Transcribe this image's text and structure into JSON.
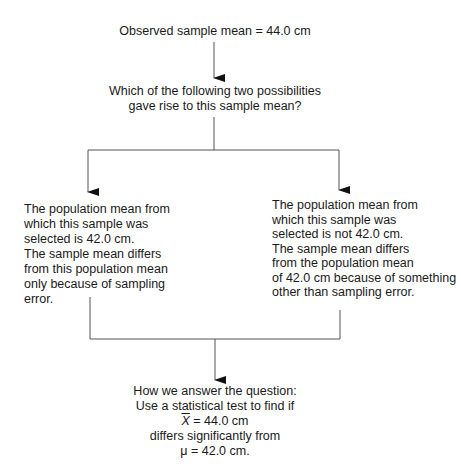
{
  "top": {
    "observed": "Observed sample mean = 44.0 cm"
  },
  "question": {
    "lines": [
      "Which of the following two possibilities",
      "gave rise to this sample mean?"
    ]
  },
  "left_option": {
    "lines": [
      "The population mean from",
      "which this sample was",
      "selected is 42.0 cm.",
      "The sample mean differs",
      "from this population mean",
      "only because of sampling",
      "error."
    ]
  },
  "right_option": {
    "lines": [
      "The population mean from",
      "which this sample was",
      "selected is not 42.0 cm.",
      "The sample mean differs",
      "from the population mean",
      "of 42.0 cm because of something",
      "other than sampling error."
    ]
  },
  "answer": {
    "line1": "How we answer the question:",
    "line2": "Use a statistical test to find if",
    "xbar_symbol": "X",
    "line3_rest": " = 44.0 cm",
    "line4": "differs significantly from",
    "line5": "μ = 42.0 cm."
  },
  "colors": {
    "line": "#555555",
    "text": "#1a1a1a"
  }
}
